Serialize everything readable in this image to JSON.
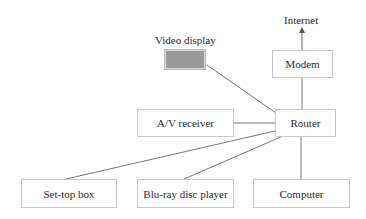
{
  "diagram": {
    "type": "home network topology",
    "colors": {
      "line": "#7a7a7a",
      "box_border": "#c8c8c8",
      "display_fill": "#9a9a9a"
    },
    "labels": {
      "internet": "Internet",
      "video_display": "Video display"
    },
    "nodes": {
      "modem": "Modem",
      "router": "Router",
      "av_receiver": "A/V receiver",
      "set_top_box": "Set-top box",
      "bluray": "Blu-ray disc player",
      "computer": "Computer"
    },
    "edges": [
      {
        "from": "Modem",
        "to": "Internet",
        "arrow": true
      },
      {
        "from": "Router",
        "to": "Modem"
      },
      {
        "from": "Router",
        "to": "Video display"
      },
      {
        "from": "Router",
        "to": "A/V receiver"
      },
      {
        "from": "Router",
        "to": "Set-top box"
      },
      {
        "from": "Router",
        "to": "Blu-ray disc player"
      },
      {
        "from": "Router",
        "to": "Computer"
      }
    ]
  }
}
